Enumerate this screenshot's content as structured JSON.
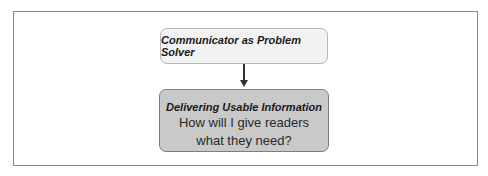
{
  "diagram": {
    "top_node": {
      "label": "Communicator as Problem Solver"
    },
    "bottom_node": {
      "title": "Delivering Usable Information",
      "question_line1": "How will I give readers",
      "question_line2": "what they need?"
    },
    "colors": {
      "top_fill": "#f2f2f2",
      "bottom_fill": "#c9c9c9",
      "frame_border": "#8a8a8a"
    }
  }
}
